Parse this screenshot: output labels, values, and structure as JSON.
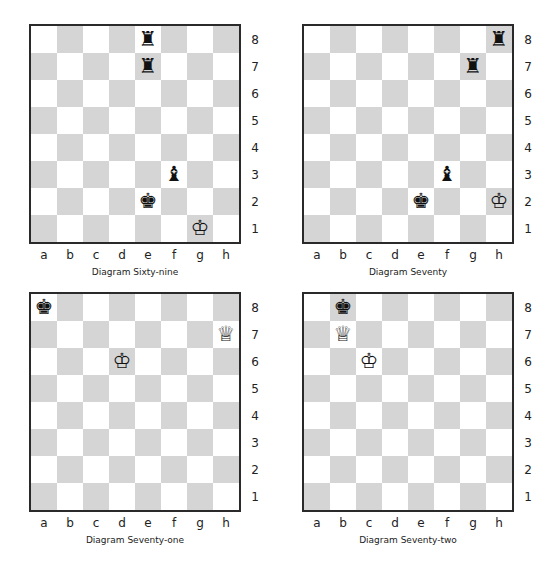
{
  "files": [
    "a",
    "b",
    "c",
    "d",
    "e",
    "f",
    "g",
    "h"
  ],
  "ranks": [
    "8",
    "7",
    "6",
    "5",
    "4",
    "3",
    "2",
    "1"
  ],
  "colors": {
    "light_square": "#ffffff",
    "dark_square": "#d5d5d5",
    "border": "#2a2a2a"
  },
  "piece_glyphs": {
    "wK": "♔",
    "wQ": "♕",
    "wR": "♖",
    "wB": "♗",
    "wN": "♘",
    "wP": "♙",
    "bK": "♚",
    "bQ": "♛",
    "bR": "♜",
    "bB": "♝",
    "bN": "♞",
    "bP": "♟"
  },
  "diagrams": [
    {
      "caption": "Diagram Sixty-nine",
      "pieces": [
        {
          "square": "e8",
          "piece": "bR"
        },
        {
          "square": "e7",
          "piece": "bR"
        },
        {
          "square": "f3",
          "piece": "bB"
        },
        {
          "square": "e2",
          "piece": "bK"
        },
        {
          "square": "g1",
          "piece": "wK"
        }
      ]
    },
    {
      "caption": "Diagram Seventy",
      "pieces": [
        {
          "square": "h8",
          "piece": "bR"
        },
        {
          "square": "g7",
          "piece": "bR"
        },
        {
          "square": "f3",
          "piece": "bB"
        },
        {
          "square": "e2",
          "piece": "bK"
        },
        {
          "square": "h2",
          "piece": "wK"
        }
      ]
    },
    {
      "caption": "Diagram Seventy-one",
      "pieces": [
        {
          "square": "a8",
          "piece": "bK"
        },
        {
          "square": "h7",
          "piece": "wQ"
        },
        {
          "square": "d6",
          "piece": "wK"
        }
      ]
    },
    {
      "caption": "Diagram Seventy-two",
      "pieces": [
        {
          "square": "b8",
          "piece": "bK"
        },
        {
          "square": "b7",
          "piece": "wQ"
        },
        {
          "square": "c6",
          "piece": "wK"
        }
      ]
    }
  ]
}
